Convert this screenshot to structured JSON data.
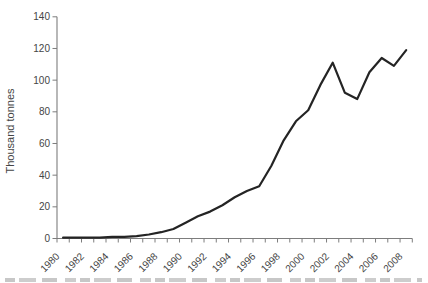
{
  "chart_data": {
    "type": "line",
    "title": "",
    "xlabel": "",
    "ylabel": "Thousand tonnes",
    "x": [
      1980,
      1981,
      1982,
      1983,
      1984,
      1985,
      1986,
      1987,
      1988,
      1989,
      1990,
      1991,
      1992,
      1993,
      1994,
      1995,
      1996,
      1997,
      1998,
      1999,
      2000,
      2001,
      2002,
      2003,
      2004,
      2005,
      2006,
      2007,
      2008
    ],
    "values": [
      0.5,
      0.5,
      0.5,
      0.5,
      1,
      1,
      1.5,
      2.5,
      4,
      6,
      10,
      14,
      17,
      21,
      26,
      30,
      33,
      46,
      62,
      74,
      81,
      97,
      111,
      92,
      88,
      105,
      114,
      109,
      119
    ],
    "ylim": [
      0,
      140
    ],
    "yticks": [
      0,
      20,
      40,
      60,
      80,
      100,
      120,
      140
    ],
    "xtick_labels": [
      "1980",
      "1982",
      "1984",
      "1986",
      "1988",
      "1990",
      "1992",
      "1994",
      "1996",
      "1998",
      "2000",
      "2002",
      "2004",
      "2006",
      "2008"
    ],
    "xtick_label_interval": 2,
    "grid": false,
    "legend": "none",
    "series_color": "#242424",
    "axis_color": "#7d7d7d",
    "tick_label_color": "#454545"
  }
}
